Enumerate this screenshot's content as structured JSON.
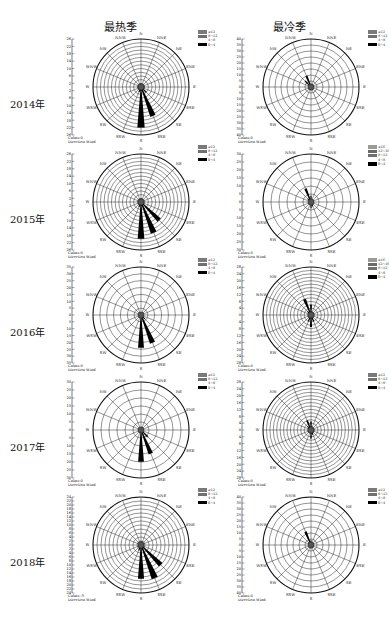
{
  "columns": [
    "最热季",
    "最冷季"
  ],
  "directions": [
    "N",
    "NNE",
    "NE",
    "ENE",
    "E",
    "ESE",
    "SE",
    "SSE",
    "S",
    "SSW",
    "SW",
    "WSW",
    "W",
    "WNW",
    "NW",
    "NNW"
  ],
  "footer": {
    "calms": "Calms:0",
    "direction": "Direction Wind"
  },
  "chart_data": {
    "type": "wind_rose",
    "title": "",
    "layout": "5 rows (years 2014–2018) × 2 columns (最热季 hottest season, 最冷季 coldest season)",
    "directions": [
      "N",
      "NNE",
      "NE",
      "ENE",
      "E",
      "ESE",
      "SE",
      "SSE",
      "S",
      "SSW",
      "SW",
      "WSW",
      "W",
      "WNW",
      "NW",
      "NNW"
    ],
    "panels": [
      {
        "year": "2014年",
        "season": "最热季",
        "axis_max": 26,
        "axis_ticks": [
          26,
          22,
          18,
          14,
          10,
          6,
          2,
          2,
          6,
          10,
          14,
          18,
          22,
          26
        ],
        "rings": 13,
        "legend": [
          "≥12",
          "8~12",
          "4~8",
          "0~4"
        ],
        "petals": {
          "S": 22,
          "SSE": 17,
          "SE": 4,
          "SSW": 3,
          "N": 2,
          "E": 2,
          "W": 2
        },
        "calms": "Calms:0"
      },
      {
        "year": "2014年",
        "season": "最冷季",
        "axis_max": 40,
        "axis_ticks": [
          40,
          35,
          30,
          25,
          20,
          15,
          10,
          5,
          0,
          5,
          10,
          15,
          20,
          25,
          30,
          35,
          40
        ],
        "rings": 8,
        "legend": [
          "≥12",
          "8~12",
          "4~8",
          "0~4"
        ],
        "petals": {
          "NNW": 10,
          "NW": 7,
          "N": 3,
          "S": 3,
          "SSE": 2
        },
        "calms": "Calms:0"
      },
      {
        "year": "2015年",
        "season": "最热季",
        "axis_max": 26,
        "axis_ticks": [
          26,
          22,
          18,
          14,
          10,
          6,
          2,
          2,
          6,
          10,
          14,
          18,
          22,
          26
        ],
        "rings": 13,
        "legend": [
          "≥12",
          "8~12",
          "4~8",
          "0~4"
        ],
        "petals": {
          "S": 20,
          "SSE": 18,
          "SE": 14,
          "SSW": 3,
          "N": 2
        },
        "calms": "Calms:0"
      },
      {
        "year": "2015年",
        "season": "最冷季",
        "axis_max": 30,
        "axis_ticks": [
          30,
          25,
          20,
          15,
          10,
          5,
          0,
          5,
          10,
          15,
          20,
          25,
          30
        ],
        "rings": 6,
        "legend": [
          "≥16",
          "12~16",
          "8~12",
          "4~8",
          "0~4"
        ],
        "petals": {
          "NNW": 9,
          "N": 4,
          "S": 4,
          "SSE": 3,
          "NW": 3
        },
        "calms": "Calms:0"
      },
      {
        "year": "2016年",
        "season": "最热季",
        "axis_max": 35,
        "axis_ticks": [
          35,
          30,
          25,
          20,
          15,
          10,
          5,
          0,
          5,
          10,
          15,
          20,
          25,
          30,
          35
        ],
        "rings": 7,
        "legend": [
          "≥12",
          "8~12",
          "4~8",
          "0~4"
        ],
        "petals": {
          "S": 24,
          "SSE": 22,
          "SE": 4,
          "N": 2
        },
        "calms": "Calms:0"
      },
      {
        "year": "2016年",
        "season": "最冷季",
        "axis_max": 28,
        "axis_ticks": [
          28,
          24,
          20,
          16,
          12,
          8,
          4,
          0,
          4,
          8,
          12,
          16,
          20,
          24,
          28
        ],
        "rings": 14,
        "legend": [
          "≥16",
          "12~16",
          "8~12",
          "4~8",
          "0~4"
        ],
        "petals": {
          "NNW": 10,
          "N": 6,
          "S": 7,
          "SSW": 4,
          "SSE": 4,
          "NW": 3
        },
        "calms": "Calms:0"
      },
      {
        "year": "2017年",
        "season": "最热季",
        "axis_max": 30,
        "axis_ticks": [
          30,
          25,
          20,
          15,
          10,
          5,
          0,
          5,
          10,
          15,
          20,
          25,
          30
        ],
        "rings": 6,
        "legend": [
          "≥12",
          "8~12",
          "4~8",
          "0~4"
        ],
        "petals": {
          "S": 20,
          "SSE": 16,
          "SE": 6,
          "N": 2
        },
        "calms": "Calms:0"
      },
      {
        "year": "2017年",
        "season": "最冷季",
        "axis_max": 28,
        "axis_ticks": [
          28,
          24,
          20,
          16,
          12,
          8,
          4,
          0,
          4,
          8,
          12,
          16,
          20,
          24,
          28
        ],
        "rings": 14,
        "legend": [
          "≥12",
          "8~12",
          "4~8",
          "0~4"
        ],
        "petals": {
          "NNW": 6,
          "N": 5,
          "S": 5,
          "SSE": 3,
          "NW": 3
        },
        "calms": "Calms:0"
      },
      {
        "year": "2018年",
        "season": "最热季",
        "axis_max": 24,
        "axis_ticks": [
          24,
          22,
          20,
          18,
          16,
          14,
          12,
          10,
          8,
          6,
          4,
          2,
          0,
          2,
          4,
          6,
          8,
          10,
          12,
          14,
          16,
          18,
          20,
          22,
          24
        ],
        "rings": 12,
        "legend": [
          "≥12",
          "8~12",
          "4~8",
          "0~4"
        ],
        "petals": {
          "S": 17,
          "SSE": 18,
          "SE": 14,
          "SSW": 3,
          "N": 2
        },
        "calms": "Calms:-9"
      },
      {
        "year": "2018年",
        "season": "最冷季",
        "axis_max": 40,
        "axis_ticks": [
          40,
          35,
          30,
          25,
          20,
          15,
          10,
          5,
          0,
          5,
          10,
          15,
          20,
          25,
          30,
          35,
          40
        ],
        "rings": 8,
        "legend": [
          "≥12",
          "8~12",
          "4~8",
          "0~4"
        ],
        "petals": {
          "NNW": 12,
          "N": 4,
          "S": 3,
          "SSE": 2,
          "NW": 3
        },
        "calms": "Calms:0"
      }
    ],
    "legend_colors": {
      "≥16": "#9a9a9a",
      "≥12": "#7a7a7a",
      "12~16": "#6a6a6a",
      "8~12": "#707070",
      "4~8": "#ffffff",
      "0~4": "#000000"
    }
  }
}
